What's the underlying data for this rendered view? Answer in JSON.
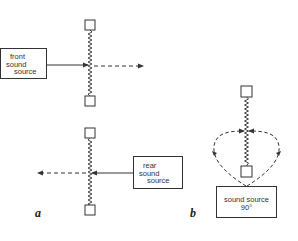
{
  "figure": {
    "panels": [
      {
        "id": "a",
        "label": "a",
        "top": {
          "source_label_lines": [
            "front",
            "sound",
            "source"
          ],
          "description": "Sound from front source pushes membrane; displacement continues forward"
        },
        "bottom": {
          "source_label_lines": [
            "rear",
            "sound",
            "source"
          ],
          "description": "Sound from rear source pushes membrane; displacement continues backward"
        }
      },
      {
        "id": "b",
        "label": "b",
        "source_label_lines": [
          "sound source",
          "90°"
        ],
        "description": "Sound from 90° source reaches both sides of membrane equally; pressures cancel"
      }
    ],
    "colors": {
      "line": "#333333",
      "background": "#ffffff"
    }
  }
}
